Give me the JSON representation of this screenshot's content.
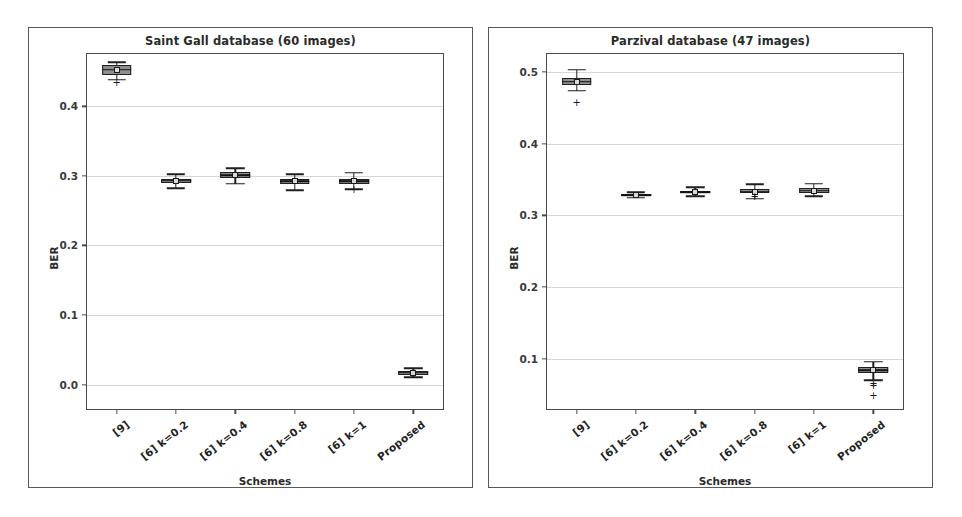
{
  "figure": {
    "background": "#ffffff",
    "panel_border_color": "#585858",
    "axis_color": "#4a4a4a",
    "grid_color": "#d6d6d6",
    "box_fill": "#8f8f8f",
    "box_edge": "#1f1f1f"
  },
  "chart_data": [
    {
      "type": "box",
      "id": "saint-gall",
      "title": "Saint Gall database (60 images)",
      "xlabel": "Schemes",
      "ylabel": "BER",
      "grid": true,
      "legend": "none",
      "ylim": [
        -0.035,
        0.475
      ],
      "yticks": [
        0.0,
        0.1,
        0.2,
        0.3,
        0.4
      ],
      "ytick_labels": [
        "0.0",
        "0.1",
        "0.2",
        "0.3",
        "0.4"
      ],
      "categories": [
        "[9]",
        "[6] k=0.2",
        "[6] k=0.4",
        "[6] k=0.8",
        "[6] k=1",
        "Proposed"
      ],
      "boxes": [
        {
          "category": "[9]",
          "q1": 0.4455,
          "median": 0.4525,
          "q3": 0.4585,
          "whisker_low": 0.438,
          "whisker_high": 0.4635,
          "mean": 0.452,
          "fliers": [
            0.433
          ]
        },
        {
          "category": "[6] k=0.2",
          "q1": 0.289,
          "median": 0.293,
          "q3": 0.296,
          "whisker_low": 0.282,
          "whisker_high": 0.3025,
          "mean": 0.293,
          "fliers": []
        },
        {
          "category": "[6] k=0.4",
          "q1": 0.297,
          "median": 0.301,
          "q3": 0.305,
          "whisker_low": 0.2885,
          "whisker_high": 0.311,
          "mean": 0.301,
          "fliers": []
        },
        {
          "category": "[6] k=0.8",
          "q1": 0.288,
          "median": 0.292,
          "q3": 0.2955,
          "whisker_low": 0.2795,
          "whisker_high": 0.302,
          "mean": 0.292,
          "fliers": []
        },
        {
          "category": "[6] k=1",
          "q1": 0.288,
          "median": 0.2925,
          "q3": 0.296,
          "whisker_low": 0.2805,
          "whisker_high": 0.3045,
          "mean": 0.2925,
          "fliers": [
            0.28
          ]
        },
        {
          "category": "Proposed",
          "q1": 0.0145,
          "median": 0.017,
          "q3": 0.0195,
          "whisker_low": 0.0105,
          "whisker_high": 0.0235,
          "mean": 0.017,
          "fliers": []
        }
      ]
    },
    {
      "type": "box",
      "id": "parzival",
      "title": "Parzival database (47 images)",
      "xlabel": "Schemes",
      "ylabel": "BER",
      "grid": true,
      "legend": "none",
      "ylim": [
        0.03,
        0.525
      ],
      "yticks": [
        0.1,
        0.2,
        0.3,
        0.4,
        0.5
      ],
      "ytick_labels": [
        "0.1",
        "0.2",
        "0.3",
        "0.4",
        "0.5"
      ],
      "categories": [
        "[9]",
        "[6] k=0.2",
        "[6] k=0.4",
        "[6] k=0.8",
        "[6] k=1",
        "Proposed"
      ],
      "boxes": [
        {
          "category": "[9]",
          "q1": 0.4815,
          "median": 0.4865,
          "q3": 0.492,
          "whisker_low": 0.4735,
          "whisker_high": 0.503,
          "mean": 0.4865,
          "fliers": [
            0.457
          ]
        },
        {
          "category": "[6] k=0.2",
          "q1": 0.327,
          "median": 0.3285,
          "q3": 0.33,
          "whisker_low": 0.3245,
          "whisker_high": 0.332,
          "mean": 0.3285,
          "fliers": []
        },
        {
          "category": "[6] k=0.4",
          "q1": 0.3305,
          "median": 0.3325,
          "q3": 0.3345,
          "whisker_low": 0.3265,
          "whisker_high": 0.339,
          "mean": 0.3325,
          "fliers": []
        },
        {
          "category": "[6] k=0.8",
          "q1": 0.3305,
          "median": 0.333,
          "q3": 0.3365,
          "whisker_low": 0.3235,
          "whisker_high": 0.3435,
          "mean": 0.333,
          "fliers": [
            0.325
          ]
        },
        {
          "category": "[6] k=1",
          "q1": 0.3315,
          "median": 0.3345,
          "q3": 0.3375,
          "whisker_low": 0.3265,
          "whisker_high": 0.344,
          "mean": 0.3345,
          "fliers": []
        },
        {
          "category": "Proposed",
          "q1": 0.08,
          "median": 0.0845,
          "q3": 0.089,
          "whisker_low": 0.07,
          "whisker_high": 0.096,
          "mean": 0.0845,
          "fliers": [
            0.065,
            0.062,
            0.048
          ]
        }
      ]
    }
  ]
}
